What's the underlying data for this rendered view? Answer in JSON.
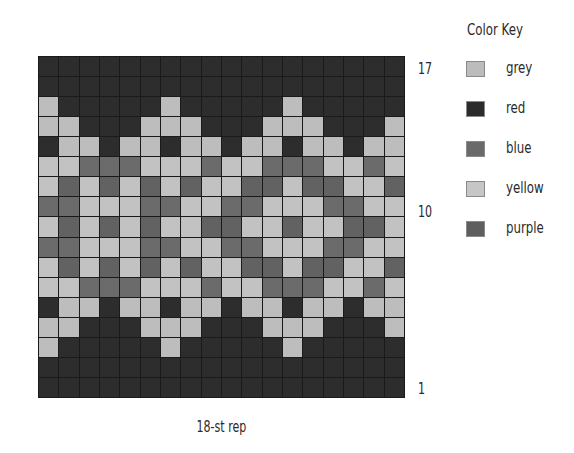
{
  "chart_data": {
    "type": "table",
    "columns": 18,
    "rows": 17,
    "xlabel": "18-st rep",
    "row_labels": [
      {
        "label": "17",
        "row": 17
      },
      {
        "label": "10",
        "row": 10
      },
      {
        "label": "1",
        "row": 1
      }
    ],
    "legend": [
      {
        "code": "G",
        "name": "grey",
        "swatch": "#bcbcbc"
      },
      {
        "code": "R",
        "name": "red",
        "swatch": "#2b2b2b"
      },
      {
        "code": "B",
        "name": "blue",
        "swatch": "#6a6a6a"
      },
      {
        "code": "Y",
        "name": "yellow",
        "swatch": "#c6c6c6"
      },
      {
        "code": "P",
        "name": "purple",
        "swatch": "#5e5e5e"
      }
    ],
    "grid": [
      "RRRRRRRRRRRRRRRRRR",
      "RRRRRRRRRRRRRRRRRR",
      "GRRRRRGRRRRRGRRRRR",
      "GGRRRGGGRRRGGGRRRG",
      "RGGRGGRGGRGGRGGRGG",
      "YYBBBYYYBYYBBBYYBY",
      "YPYPYPYPYYPPYPPYYP",
      "BBYYYBBYYBBYYYBBYY",
      "YPYPYPYYPPYYPYYPPY",
      "BBYYYBBYYBBYYYBBYY",
      "YPYPYPYPYYPPYPPYYP",
      "YYBBBYYYBYYBBBYYBY",
      "RGGRGGRGGRGGRGGRGG",
      "GGRRRGGGRRRGGGRRRG",
      "GRRRRRGRRRRRGRRRRR",
      "RRRRRRRRRRRRRRRRRR",
      "RRRRRRRRRRRRRRRRRR"
    ]
  },
  "labels": {
    "row_17": "17",
    "row_10": "10",
    "row_1": "1",
    "repeat": "18-st rep"
  },
  "key": {
    "title": "Color Key",
    "items": [
      {
        "label": "grey",
        "color": "#bcbcbc"
      },
      {
        "label": "red",
        "color": "#2b2b2b"
      },
      {
        "label": "blue",
        "color": "#6a6a6a"
      },
      {
        "label": "yellow",
        "color": "#c6c6c6"
      },
      {
        "label": "purple",
        "color": "#5e5e5e"
      }
    ]
  },
  "cell_colors": {
    "G": "#bdbdbd",
    "Y": "#c2c2c2",
    "R": "#2d2d2d",
    "B": "#6b6b6b",
    "P": "#626262"
  }
}
